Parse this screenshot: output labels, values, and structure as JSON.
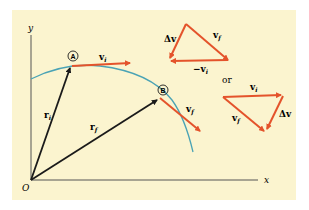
{
  "diagram": {
    "axes": {
      "y_label": "y",
      "x_label": "x",
      "origin_label": "O"
    },
    "points": {
      "A": "A",
      "B": "B"
    },
    "vectors": {
      "r_i": {
        "base": "r",
        "sub": "i"
      },
      "r_f": {
        "base": "r",
        "sub": "f"
      },
      "v_i": {
        "base": "v",
        "sub": "i"
      },
      "v_f": {
        "base": "v",
        "sub": "f"
      }
    },
    "triangle_top": {
      "dv": "Δv",
      "vf": {
        "base": "v",
        "sub": "f"
      },
      "neg_vi": {
        "base": "−v",
        "sub": "i"
      }
    },
    "or_label": "or",
    "triangle_bottom": {
      "vi": {
        "base": "v",
        "sub": "i"
      },
      "vf": {
        "base": "v",
        "sub": "f"
      },
      "dv": "Δv"
    },
    "colors": {
      "background": "#fbf4cf",
      "velocity": "#e4532b",
      "position": "#1a1a1a",
      "trajectory": "#4aa3b5",
      "axis": "#555555"
    }
  }
}
